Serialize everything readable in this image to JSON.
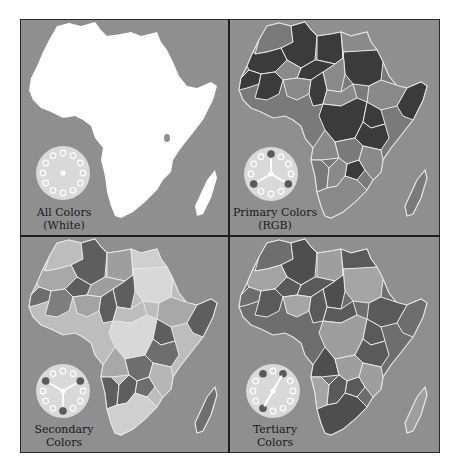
{
  "figure": {
    "panels": [
      {
        "id": "all-colors",
        "caption_line1": "All Colors",
        "caption_line2": "(White)",
        "map_style": "solid-white",
        "wheel_marked_positions": [],
        "wheel_hands": "none"
      },
      {
        "id": "primary-colors",
        "caption_line1": "Primary Colors",
        "caption_line2": "(RGB)",
        "map_style": "countries-primary",
        "wheel_marked_positions": [
          0,
          4,
          8
        ],
        "wheel_hands": "three-way"
      },
      {
        "id": "secondary-colors",
        "caption_line1": "Secondary",
        "caption_line2": "Colors",
        "map_style": "countries-secondary",
        "wheel_marked_positions": [
          2,
          6,
          10
        ],
        "wheel_hands": "three-way"
      },
      {
        "id": "tertiary-colors",
        "caption_line1": "Tertiary",
        "caption_line2": "Colors",
        "map_style": "countries-tertiary",
        "wheel_marked_positions": [
          1,
          7,
          11
        ],
        "wheel_hands": "two-way"
      }
    ],
    "colors": {
      "ocean": "#8f8f8f",
      "land_white": "#ffffff",
      "border": "#e8e8e8",
      "divider": "#1e1e1e",
      "wheel_face": "#d9d9d9",
      "wheel_dot": "#ffffff",
      "wheel_marked": "#5a5a5a"
    }
  }
}
